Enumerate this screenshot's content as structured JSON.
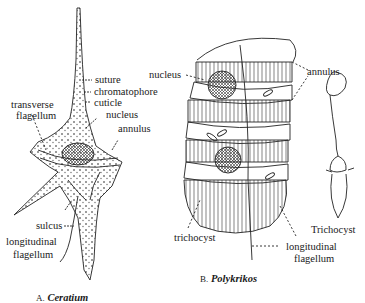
{
  "figure": {
    "panel_a": {
      "caption_letter": "A.",
      "caption_name": "Ceratium",
      "labels": {
        "suture": "suture",
        "chromatophore": "chromatophore",
        "cuticle": "cuticle",
        "nucleus": "nucleus",
        "annulus": "annulus",
        "transverse_flagellum_1": "transverse",
        "transverse_flagellum_2": "flagellum",
        "sulcus": "sulcus",
        "longitudinal_flagellum_1": "longitudinal",
        "longitudinal_flagellum_2": "flagellum"
      }
    },
    "panel_b": {
      "caption_letter": "B.",
      "caption_name": "Polykrikos",
      "labels": {
        "nucleus": "nucleus",
        "annulus": "annulus",
        "trichocyst": "trichocyst",
        "longitudinal_flagellum_1": "longitudinal",
        "longitudinal_flagellum_2": "flagellum"
      }
    },
    "trichocyst_inset": {
      "label": "Trichocyst"
    },
    "colors": {
      "ink": "#1a1a1a",
      "background": "#ffffff"
    }
  }
}
